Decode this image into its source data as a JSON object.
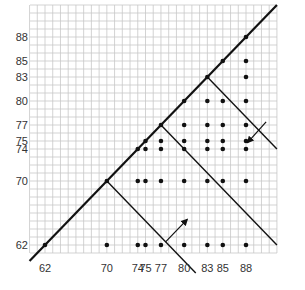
{
  "chart_data": {
    "type": "scatter",
    "title": "",
    "xlabel": "",
    "ylabel": "",
    "xlim": [
      60,
      92
    ],
    "ylim": [
      59,
      92
    ],
    "grid": true,
    "x_ticks": [
      62,
      70,
      74,
      75,
      77,
      80,
      83,
      85,
      88
    ],
    "y_ticks": [
      62,
      70,
      74,
      75,
      77,
      80,
      83,
      85,
      88
    ],
    "points": [
      [
        88,
        88
      ],
      [
        85,
        85
      ],
      [
        88,
        85
      ],
      [
        83,
        83
      ],
      [
        88,
        83
      ],
      [
        80,
        80
      ],
      [
        83,
        80
      ],
      [
        85,
        80
      ],
      [
        88,
        80
      ],
      [
        77,
        77
      ],
      [
        80,
        77
      ],
      [
        83,
        77
      ],
      [
        85,
        77
      ],
      [
        88,
        77
      ],
      [
        75,
        75
      ],
      [
        77,
        75
      ],
      [
        80,
        75
      ],
      [
        83,
        75
      ],
      [
        85,
        75
      ],
      [
        88,
        75
      ],
      [
        74,
        74
      ],
      [
        75,
        74
      ],
      [
        77,
        74
      ],
      [
        80,
        74
      ],
      [
        83,
        74
      ],
      [
        85,
        74
      ],
      [
        88,
        74
      ],
      [
        70,
        70
      ],
      [
        74,
        70
      ],
      [
        75,
        70
      ],
      [
        77,
        70
      ],
      [
        80,
        70
      ],
      [
        83,
        70
      ],
      [
        85,
        70
      ],
      [
        88,
        70
      ],
      [
        62,
        62
      ],
      [
        70,
        62
      ],
      [
        74,
        62
      ],
      [
        75,
        62
      ],
      [
        77,
        62
      ],
      [
        80,
        62
      ],
      [
        83,
        62
      ],
      [
        85,
        62
      ],
      [
        88,
        62
      ]
    ],
    "lines": [
      {
        "name": "diagonal y=x",
        "from": [
          60,
          60
        ],
        "to": [
          92,
          92
        ]
      },
      {
        "name": "x+y=140",
        "from": [
          70,
          70
        ],
        "to": [
          81.5,
          58.5
        ]
      },
      {
        "name": "x+y=154",
        "from": [
          77,
          77
        ],
        "to": [
          92,
          62
        ]
      },
      {
        "name": "x+y=166",
        "from": [
          83,
          83
        ],
        "to": [
          92,
          74
        ]
      }
    ],
    "arrows": [
      {
        "from": [
          77.6,
          62.4
        ],
        "to": [
          80.4,
          65.2
        ],
        "direction": "up-right"
      },
      {
        "from": [
          90.6,
          77.4
        ],
        "to": [
          88.2,
          74.8
        ],
        "direction": "down-left"
      }
    ],
    "legend": null
  },
  "colors": {
    "grid": "#c8c8c8",
    "line": "#111111",
    "point": "#111111",
    "text": "#333333"
  }
}
